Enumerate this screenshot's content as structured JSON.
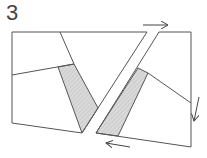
{
  "figure": {
    "number_label": "3",
    "colors": {
      "stroke": "#555555",
      "shade": "#d6d6d6",
      "arrow": "#444444"
    },
    "left_block": {
      "outline": "12,32 147,32 98,108 82,133 12,123",
      "inner_line": "60,32 74,64",
      "cross_line": "12,75 74,64",
      "shaded": "58,67 74,64 98,108 82,133"
    },
    "right_block": {
      "outline": "159,32 191,32 191,147 96,133",
      "inner_line": "148,73 191,103",
      "shaded": "138,68 148,73 118,136 96,133"
    },
    "arrows": [
      {
        "name": "arrow-right-icon",
        "x1": 143,
        "y1": 25,
        "x2": 168,
        "y2": 25
      },
      {
        "name": "arrow-down-icon",
        "x1": 199,
        "y1": 97,
        "x2": 194,
        "y2": 121
      },
      {
        "name": "arrow-left-icon",
        "x1": 130,
        "y1": 147,
        "x2": 106,
        "y2": 143
      }
    ]
  }
}
